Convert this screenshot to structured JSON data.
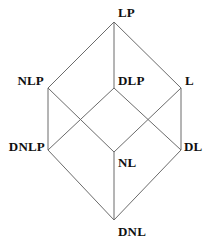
{
  "diagram": {
    "type": "hasse-diagram",
    "title": "",
    "width": 209,
    "height": 243,
    "background_color": "#ffffff",
    "edge_color": "#6b6b6b",
    "label_color": "#101010",
    "nodes": [
      {
        "id": "LP",
        "label": "LP",
        "x": 114,
        "y": 22,
        "label_x": 118,
        "label_y": 12,
        "anchor": "left"
      },
      {
        "id": "NLP",
        "label": "NLP",
        "x": 48,
        "y": 88,
        "label_x": 44,
        "label_y": 80,
        "anchor": "right"
      },
      {
        "id": "DLP",
        "label": "DLP",
        "x": 114,
        "y": 88,
        "label_x": 118,
        "label_y": 80,
        "anchor": "left"
      },
      {
        "id": "L",
        "label": "L",
        "x": 181,
        "y": 88,
        "label_x": 185,
        "label_y": 80,
        "anchor": "left"
      },
      {
        "id": "DNLP",
        "label": "DNLP",
        "x": 48,
        "y": 150,
        "label_x": 45,
        "label_y": 146,
        "anchor": "right"
      },
      {
        "id": "NL",
        "label": "NL",
        "x": 114,
        "y": 152,
        "label_x": 118,
        "label_y": 162,
        "anchor": "left"
      },
      {
        "id": "DL",
        "label": "DL",
        "x": 181,
        "y": 150,
        "label_x": 184,
        "label_y": 146,
        "anchor": "left"
      },
      {
        "id": "DNL",
        "label": "DNL",
        "x": 114,
        "y": 220,
        "label_x": 118,
        "label_y": 231,
        "anchor": "left"
      }
    ],
    "edges": [
      {
        "from": "LP",
        "to": "NLP"
      },
      {
        "from": "LP",
        "to": "DLP"
      },
      {
        "from": "LP",
        "to": "L"
      },
      {
        "from": "NLP",
        "to": "DNLP"
      },
      {
        "from": "NLP",
        "to": "NL"
      },
      {
        "from": "DLP",
        "to": "DNLP"
      },
      {
        "from": "DLP",
        "to": "DL"
      },
      {
        "from": "L",
        "to": "NL"
      },
      {
        "from": "L",
        "to": "DL"
      },
      {
        "from": "DNLP",
        "to": "DNL"
      },
      {
        "from": "NL",
        "to": "DNL"
      },
      {
        "from": "DL",
        "to": "DNL"
      }
    ]
  }
}
